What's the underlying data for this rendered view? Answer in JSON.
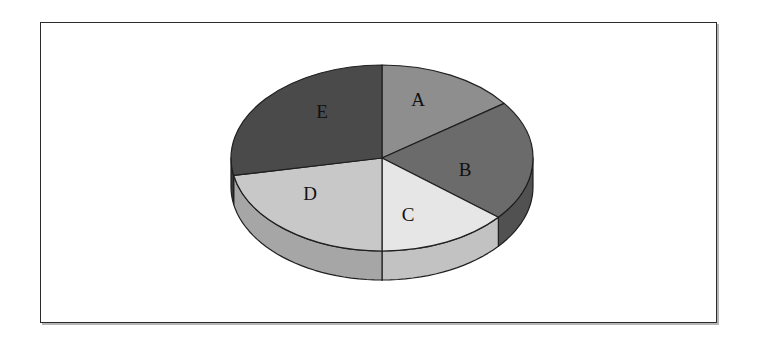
{
  "figure": {
    "background_color": "#ffffff",
    "frame": {
      "border_color": "#2b2b2b",
      "shadow_color": "#787878",
      "x": 40,
      "y": 22,
      "width": 677,
      "height": 301
    }
  },
  "chart_data": {
    "type": "pie",
    "title": "",
    "subtitle": "",
    "xlabel": "",
    "ylabel": "",
    "three_d": true,
    "start_angle_deg": 90,
    "direction": "clockwise",
    "legend_position": "none",
    "grid": false,
    "labels_inside": true,
    "center": {
      "cx": 382,
      "cy": 158
    },
    "geometry": {
      "rx": 151,
      "ry": 93,
      "depth": 29
    },
    "categories": [
      "A",
      "B",
      "C",
      "D",
      "E"
    ],
    "values": [
      15,
      21,
      14,
      22,
      28
    ],
    "percentages": [
      15,
      21,
      14,
      22,
      28
    ],
    "slice_angles_deg": [
      54,
      75.6,
      50.4,
      79.2,
      100.8
    ],
    "colors": [
      "#8e8e8e",
      "#6b6b6b",
      "#e6e6e6",
      "#c8c8c8",
      "#4a4a4a"
    ],
    "side_colors": [
      "#707070",
      "#515151",
      "#c2c2c2",
      "#a6a6a6",
      "#383838"
    ],
    "edge_color": "#1f1f1f",
    "slices": [
      {
        "label": "A",
        "value": 15,
        "percent": 15,
        "color": "#8e8e8e",
        "side_color": "#707070",
        "start_deg": 90,
        "sweep_deg": 54,
        "label_x": 418,
        "label_y": 99
      },
      {
        "label": "B",
        "value": 21,
        "percent": 21,
        "color": "#6b6b6b",
        "side_color": "#515151",
        "start_deg": 36,
        "sweep_deg": 75.6,
        "label_x": 465,
        "label_y": 169
      },
      {
        "label": "C",
        "value": 14,
        "percent": 14,
        "color": "#e6e6e6",
        "side_color": "#c2c2c2",
        "start_deg": -39.6,
        "sweep_deg": 50.4,
        "label_x": 408,
        "label_y": 214
      },
      {
        "label": "D",
        "value": 22,
        "percent": 22,
        "color": "#c8c8c8",
        "side_color": "#a6a6a6",
        "start_deg": -90,
        "sweep_deg": 79.2,
        "label_x": 310,
        "label_y": 193
      },
      {
        "label": "E",
        "value": 28,
        "percent": 28,
        "color": "#4a4a4a",
        "side_color": "#383838",
        "start_deg": -169.2,
        "sweep_deg": 100.8,
        "label_x": 322,
        "label_y": 111
      }
    ]
  }
}
